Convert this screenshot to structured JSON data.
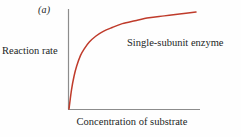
{
  "figure": {
    "panel_label": "(a)",
    "background_color": "#fefefe"
  },
  "chart_data": {
    "type": "line",
    "title": "",
    "subtitle": "",
    "panel_label": "(a)",
    "xlabel": "Concentration of substrate",
    "ylabel": "Reaction rate",
    "grid": false,
    "legend_position": "inside-upper-right",
    "axis_color": "#8c8c8c",
    "annotations": [
      {
        "text": "Single-subunit enzyme",
        "x_frac": 0.46,
        "y_frac": 0.72
      }
    ],
    "axes": {
      "x_ticks": [],
      "y_ticks": [],
      "xlim": [
        0,
        1
      ],
      "ylim": [
        0,
        1
      ],
      "x_tick_labels": [],
      "y_tick_labels": []
    },
    "series": [
      {
        "name": "Single-subunit enzyme",
        "color": "#bf3b2b",
        "shape": "hyperbolic-michaelis-menten",
        "x": [
          0.0,
          0.02,
          0.04,
          0.06,
          0.09,
          0.12,
          0.16,
          0.21,
          0.27,
          0.34,
          0.42,
          0.52,
          0.63,
          0.75,
          0.87,
          1.0
        ],
        "y": [
          0.0,
          0.2,
          0.34,
          0.44,
          0.55,
          0.62,
          0.69,
          0.75,
          0.8,
          0.84,
          0.88,
          0.91,
          0.94,
          0.96,
          0.98,
          1.0
        ]
      }
    ]
  },
  "labels": {
    "y_axis": "Reaction rate",
    "x_axis": "Concentration of substrate",
    "series_annotation": "Single-subunit enzyme"
  }
}
